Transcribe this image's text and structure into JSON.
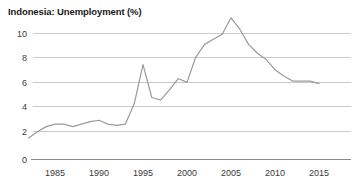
{
  "chart_data": {
    "type": "line",
    "title": "Indonesia: Unemployment (%)",
    "xlabel": "",
    "ylabel": "",
    "xlim": [
      1982,
      2016
    ],
    "ylim": [
      0,
      11.8
    ],
    "grid": true,
    "legend": "none",
    "yticks": [
      "0",
      "2",
      "4",
      "6",
      "8",
      "10"
    ],
    "ytick_values": [
      0,
      2,
      4,
      6,
      8,
      10
    ],
    "xticks": [
      "1985",
      "1990",
      "1995",
      "2000",
      "2005",
      "2010",
      "2015"
    ],
    "xtick_values": [
      1985,
      1990,
      1995,
      2000,
      2005,
      2010,
      2015
    ],
    "series": [
      {
        "name": "Unemployment rate",
        "color": "#9a9a9a",
        "x": [
          1982,
          1983,
          1984,
          1985,
          1986,
          1987,
          1988,
          1989,
          1990,
          1991,
          1992,
          1993,
          1994,
          1995,
          1996,
          1997,
          1998,
          1999,
          2000,
          2001,
          2002,
          2003,
          2004,
          2005,
          2006,
          2007,
          2008,
          2009,
          2010,
          2011,
          2012,
          2013,
          2014,
          2015
        ],
        "values": [
          1.7,
          2.2,
          2.6,
          2.8,
          2.8,
          2.6,
          2.8,
          3.0,
          3.1,
          2.8,
          2.7,
          2.8,
          4.4,
          7.5,
          4.9,
          4.7,
          5.5,
          6.4,
          6.1,
          8.1,
          9.1,
          9.5,
          9.9,
          11.2,
          10.3,
          9.1,
          8.4,
          7.9,
          7.1,
          6.6,
          6.2,
          6.2,
          6.2,
          6.0
        ]
      }
    ]
  },
  "axes": {
    "y_labels": [
      "10",
      "8",
      "6",
      "4",
      "2",
      "0"
    ],
    "x_labels": [
      "1985",
      "1990",
      "1995",
      "2000",
      "2005",
      "2010",
      "2015"
    ]
  },
  "colors": {
    "line": "#9a9a9a",
    "grid": "#bdbdbd",
    "axis": "#8a8a8a",
    "text": "#3a3a3a",
    "title": "#1a1a1a",
    "background": "#ffffff"
  }
}
